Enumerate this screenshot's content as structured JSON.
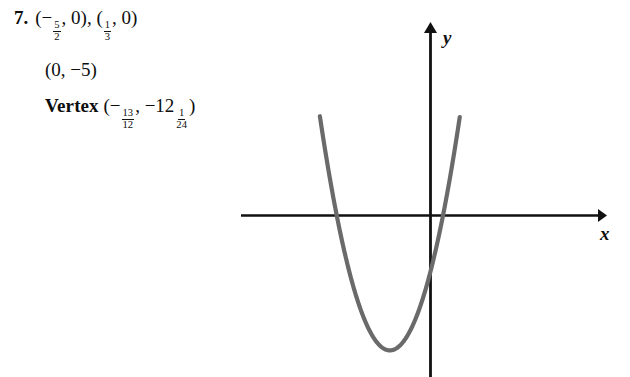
{
  "page": {
    "background_color": "#ffffff",
    "text_color": "#0d0d0d"
  },
  "problem": {
    "number": "7.",
    "line1": {
      "point_a": {
        "open": "(",
        "sign": "−",
        "frac_num": "5",
        "frac_den": "2",
        "comma": ", ",
        "y": "0",
        "close": ")"
      },
      "separator": ", ",
      "point_b": {
        "open": "(",
        "frac_num": "1",
        "frac_den": "3",
        "comma": ", ",
        "y": "0",
        "close": ")"
      }
    },
    "line2": {
      "text": "(0, −5)"
    },
    "line3": {
      "label": "Vertex",
      "open": " (",
      "x_sign": "−",
      "x_frac_num": "13",
      "x_frac_den": "12",
      "comma": ", ",
      "y_sign": "−",
      "y_whole": "12",
      "y_frac_num": "1",
      "y_frac_den": "24",
      "close": ")"
    }
  },
  "graph": {
    "x_axis_label": "x",
    "y_axis_label": "y",
    "axis_color": "#111111",
    "curve_color": "#6a6a6a",
    "curve_highlight_color": "#8d8d8d"
  },
  "chart_data": {
    "type": "line",
    "title": "",
    "xlabel": "x",
    "ylabel": "y",
    "grid": false,
    "legend": null,
    "function": "y = 6x^2 + 13x - 5",
    "x_intercepts": [
      -2.5,
      0.3333333333
    ],
    "y_intercept": -5,
    "vertex": [
      -1.0833333333,
      -12.0416666667
    ],
    "xlim": [
      -4.6,
      7.3
    ],
    "ylim": [
      -16.5,
      17.5
    ],
    "curve_x_range": [
      -2.95,
      0.78
    ],
    "series": [
      {
        "name": "parabola",
        "x": [
          -2.95,
          -2.75,
          -2.5,
          -2.25,
          -2.0,
          -1.75,
          -1.5,
          -1.25,
          -1.0833,
          -0.75,
          -0.5,
          -0.25,
          0.0,
          0.3333,
          0.5,
          0.65,
          0.78
        ],
        "y": [
          8.9,
          4.6,
          -0.0,
          -4.0,
          -7.0,
          -9.3,
          -11.0,
          -11.875,
          -12.04,
          -11.4,
          -10.0,
          -7.9,
          -5.0,
          0.0,
          3.0,
          5.98,
          9.3
        ]
      }
    ]
  }
}
